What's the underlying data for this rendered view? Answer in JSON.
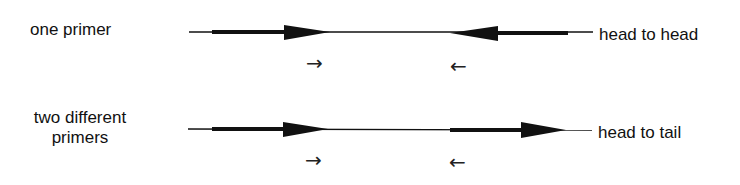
{
  "rows": [
    {
      "left_label": "one primer",
      "right_label": "head to head",
      "small_arrows": [
        "→",
        "←"
      ]
    },
    {
      "left_label_line1": "two different",
      "left_label_line2": "primers",
      "right_label": "head to tail",
      "small_arrows": [
        "→",
        "←"
      ]
    }
  ],
  "colors": {
    "ink": "#111111",
    "background": "#ffffff"
  }
}
